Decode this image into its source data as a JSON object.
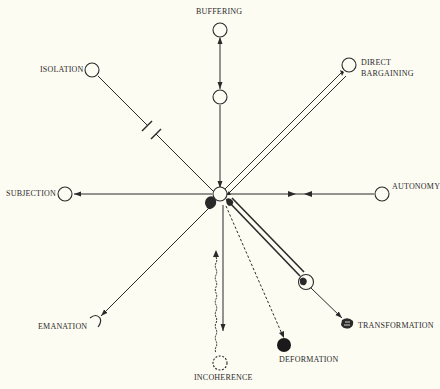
{
  "diagram": {
    "type": "radial-strategy-diagram",
    "center": {
      "x": 220,
      "y": 197
    },
    "nodes": {
      "buffering": {
        "label": "BUFFERING",
        "x": 220,
        "y": 30
      },
      "buffering_mid": {
        "label": "",
        "x": 220,
        "y": 97
      },
      "direct_bargaining": {
        "label": "DIRECT\nBARGAINING",
        "line1": "DIRECT",
        "line2": "BARGAINING",
        "x": 349,
        "y": 65
      },
      "autonomy": {
        "label": "AUTONOMY",
        "x": 382,
        "y": 194
      },
      "transformation": {
        "label": "TRANSFORMATION",
        "x": 348,
        "y": 324
      },
      "transformation_mid": {
        "label": "",
        "x": 306,
        "y": 282
      },
      "deformation": {
        "label": "DEFORMATION",
        "x": 284,
        "y": 345
      },
      "incoherence": {
        "label": "INCOHERENCE",
        "x": 220,
        "y": 363
      },
      "emanation": {
        "label": "EMANATION",
        "x": 95,
        "y": 323
      },
      "subjection": {
        "label": "SUBJECTION",
        "x": 65,
        "y": 194
      },
      "isolation": {
        "label": "ISOLATION",
        "x": 92,
        "y": 70
      }
    },
    "edges": [
      {
        "from": "buffering",
        "to": "buffering_mid",
        "style": "double-headed arrow"
      },
      {
        "from": "buffering_mid",
        "to": "center",
        "style": "arrow toward center"
      },
      {
        "from": "center",
        "to": "direct_bargaining",
        "style": "double line, bidirectional"
      },
      {
        "from": "autonomy",
        "to": "center",
        "style": "line with opposing arrows"
      },
      {
        "from": "center",
        "to": "transformation_mid",
        "style": "thick hatched double line"
      },
      {
        "from": "transformation_mid",
        "to": "transformation",
        "style": "arrow"
      },
      {
        "from": "center",
        "to": "deformation",
        "style": "dashed arrow"
      },
      {
        "from": "center",
        "to": "incoherence",
        "style": "solid arrow + wavy dashed line"
      },
      {
        "from": "center",
        "to": "emanation",
        "style": "arrow"
      },
      {
        "from": "center",
        "to": "subjection",
        "style": "arrow"
      },
      {
        "from": "center",
        "to": "isolation",
        "style": "broken line (break marks)"
      }
    ]
  },
  "colors": {
    "background": "#fdfcf3",
    "ink": "#2a2a2a"
  }
}
